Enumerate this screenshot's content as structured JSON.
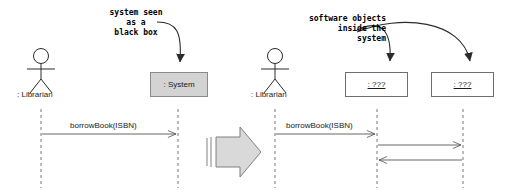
{
  "diagram": {
    "colors": {
      "system_box_fill": "#d3d3d3",
      "system_box_stroke": "#8a8a8a",
      "object_box_fill": "#ffffff",
      "object_box_stroke": "#6e6e6e",
      "line": "#555555",
      "annotation_text": "#000000",
      "block_arrow_fill": "#d9d9d9",
      "block_arrow_stroke": "#808080",
      "background": "#ffffff"
    }
  },
  "left_panel": {
    "annotation": {
      "line1": "system seen",
      "line2": "as a",
      "line3": "black box"
    },
    "actor": {
      "label": ": Librarian",
      "icon": "actor-stick-figure-icon"
    },
    "participants": [
      {
        "label": ": System",
        "style": "shaded"
      }
    ],
    "messages": [
      {
        "label": "borrowBook(ISBN)",
        "direction": "right",
        "from": ": Librarian",
        "to": ": System"
      }
    ]
  },
  "transition": {
    "icon": "block-arrow-right-icon",
    "meaning": "refines into"
  },
  "right_panel": {
    "annotation": {
      "line1": "software objects",
      "line2": "inside the",
      "line3": "system"
    },
    "actor": {
      "label": ": Librarian",
      "icon": "actor-stick-figure-icon"
    },
    "participants": [
      {
        "label": ": ???",
        "style": "plain"
      },
      {
        "label": ": ???",
        "style": "plain"
      }
    ],
    "messages": [
      {
        "label": "borrowBook(ISBN)",
        "direction": "right",
        "from": ": Librarian",
        "to": ": ???"
      },
      {
        "label": "",
        "direction": "right",
        "from": ": ???",
        "to": ": ???"
      },
      {
        "label": "",
        "direction": "left",
        "from": ": ???",
        "to": ": ???"
      }
    ]
  }
}
